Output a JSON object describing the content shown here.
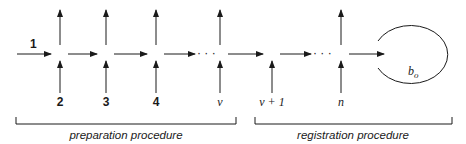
{
  "diagram": {
    "input_label": "1",
    "nodes": [
      {
        "id": "n2",
        "label": "2",
        "style": "bold",
        "x": 60,
        "has_output": true
      },
      {
        "id": "n3",
        "label": "3",
        "style": "bold",
        "x": 106,
        "has_output": true
      },
      {
        "id": "n4",
        "label": "4",
        "style": "bold",
        "x": 156,
        "has_output": true
      },
      {
        "id": "nv",
        "label": "ν",
        "style": "italic",
        "x": 220,
        "has_output": true
      },
      {
        "id": "nv1",
        "label": "ν + 1",
        "style": "italic",
        "x": 272,
        "has_output": false
      },
      {
        "id": "nn",
        "label": "n",
        "style": "italic",
        "x": 341,
        "has_output": true
      }
    ],
    "ellipsis": "· · ·",
    "loop_label": "b",
    "loop_subscript": "o",
    "brackets": [
      {
        "label": "preparation procedure",
        "x1": 16,
        "x2": 236
      },
      {
        "label": "registration procedure",
        "x1": 255,
        "x2": 452
      }
    ],
    "colors": {
      "ink": "#1a1a1a",
      "background": "#ffffff"
    }
  }
}
